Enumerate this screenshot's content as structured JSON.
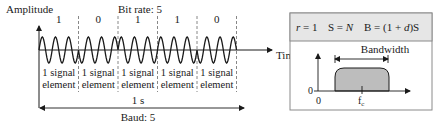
{
  "left_figure": {
    "amplitude_label": "Amplitude",
    "time_label": "Time",
    "bit_rate_label": "Bit rate: 5",
    "bits": [
      "1",
      "0",
      "1",
      "1",
      "0"
    ],
    "signal_element_line1": "1 signal",
    "signal_element_line2": "element",
    "duration_label": "1 s",
    "baud_label": "Baud: 5",
    "cycles_per_element": 3,
    "modulation": "phase"
  },
  "right_figure": {
    "header": {
      "r_label": "r = 1",
      "s_label": "S = N",
      "b_label": "B = (1 + d)S"
    },
    "bandwidth_label": "Bandwidth",
    "y_zero_label": "0",
    "x_zero_label": "0",
    "center_freq_label": "f",
    "center_freq_subscript": "c"
  },
  "colors": {
    "ink": "#1a1a1a",
    "header_bg": "#e6e6e6",
    "panel_border": "#8a8a8a",
    "spectrum_fill": "#bdbdbd",
    "dashed": "#6a6a6a"
  }
}
